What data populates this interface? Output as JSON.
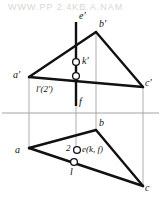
{
  "figure": {
    "watermark_text": "WWW.PP  2.4KB.A.NAM",
    "colors": {
      "ink": "#111111",
      "thin_line": "#9a9a9a",
      "background": "#ffffff",
      "watermark": "#ded6d2"
    },
    "reference_line": {
      "name": "ground-line",
      "y": 113
    }
  },
  "labels": {
    "a_prime": "a'",
    "b_prime": "b'",
    "c_prime": "c'",
    "e_prime": "e'",
    "k_prime": "k'",
    "f_prime": "f",
    "l_prime_2_prime": "l'(2')",
    "a": "a",
    "b": "b",
    "c": "c",
    "two": "2",
    "e_k_f": "e(k, f)",
    "l": "l"
  },
  "geometry": {
    "front_view": {
      "name": "front-view-triangle",
      "a_prime": [
        29,
        77
      ],
      "b_prime": [
        96,
        32
      ],
      "c_prime": [
        143,
        87
      ],
      "e_prime_top": [
        76,
        22
      ],
      "f_bottom": [
        76,
        106
      ],
      "k_prime_point": [
        76,
        62
      ],
      "l_prime_point": [
        76,
        76
      ]
    },
    "top_view": {
      "name": "top-view-triangle",
      "a": [
        29,
        148
      ],
      "b": [
        96,
        130
      ],
      "c": [
        143,
        186
      ],
      "e_point": [
        77,
        150
      ],
      "l_point": [
        74,
        162
      ]
    },
    "projectors": [
      {
        "name": "projector-a",
        "x": 29,
        "y1": 77,
        "y2": 148
      },
      {
        "name": "projector-b",
        "x": 96,
        "y1": 32,
        "y2": 130
      },
      {
        "name": "projector-c",
        "x": 143,
        "y1": 87,
        "y2": 186
      },
      {
        "name": "projector-ef",
        "x": 76,
        "y1": 22,
        "y2": 162
      }
    ]
  }
}
